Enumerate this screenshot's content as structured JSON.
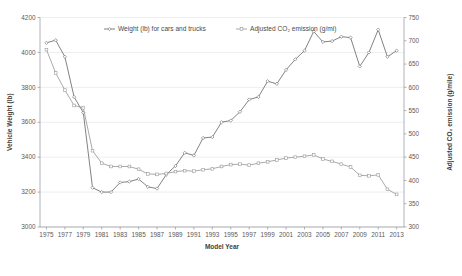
{
  "chart_data": {
    "type": "line",
    "title": "",
    "xlabel": "Model Year",
    "ylabel": "Vehicle Weight (lb)",
    "y2label": "Adjusted CO₂ emission (g/mile)",
    "x": [
      1975,
      1976,
      1977,
      1978,
      1979,
      1980,
      1981,
      1982,
      1983,
      1984,
      1985,
      1986,
      1987,
      1988,
      1989,
      1990,
      1991,
      1992,
      1993,
      1994,
      1995,
      1996,
      1997,
      1998,
      1999,
      2000,
      2001,
      2002,
      2003,
      2004,
      2005,
      2006,
      2007,
      2008,
      2009,
      2010,
      2011,
      2012,
      2013
    ],
    "xtick_labels": [
      "1975",
      "1977",
      "1979",
      "1981",
      "1983",
      "1985",
      "1987",
      "1989",
      "1991",
      "1993",
      "1995",
      "1997",
      "1999",
      "2001",
      "2003",
      "2005",
      "2007",
      "2009",
      "2011",
      "2013"
    ],
    "xtick_values": [
      1975,
      1977,
      1979,
      1981,
      1983,
      1985,
      1987,
      1989,
      1991,
      1993,
      1995,
      1997,
      1999,
      2001,
      2003,
      2005,
      2007,
      2009,
      2011,
      2013
    ],
    "xlim": [
      1974.3,
      2013.8
    ],
    "ylim": [
      3000,
      4200
    ],
    "ytick_values": [
      3000,
      3200,
      3400,
      3600,
      3800,
      4000,
      4200
    ],
    "ytick_labels": [
      "3000",
      "3200",
      "3400",
      "3600",
      "3800",
      "4000",
      "4200"
    ],
    "y2lim": [
      300,
      750
    ],
    "y2tick_values": [
      300,
      350,
      400,
      450,
      500,
      550,
      600,
      650,
      700,
      750
    ],
    "y2tick_labels": [
      "300",
      "350",
      "400",
      "450",
      "500",
      "550",
      "600",
      "650",
      "700",
      "750"
    ],
    "grid": true,
    "legend_position": "top-center",
    "series": [
      {
        "name": "Weight (lb) for cars and trucks",
        "axis": "left",
        "color": "#6b6b6b",
        "marker": "diamond",
        "values": [
          4055,
          4070,
          3975,
          3745,
          3655,
          3225,
          3200,
          3200,
          3255,
          3260,
          3275,
          3230,
          3220,
          3300,
          3350,
          3425,
          3410,
          3510,
          3515,
          3600,
          3610,
          3660,
          3730,
          3745,
          3835,
          3820,
          3900,
          3960,
          4010,
          4120,
          4060,
          4065,
          4090,
          4085,
          3920,
          4000,
          4130,
          3975,
          4010
        ]
      },
      {
        "name": "Adjusted CO₂ emission (g/mi)",
        "axis": "right",
        "color": "#9a9a9a",
        "marker": "square",
        "values": [
          681,
          631,
          594,
          561,
          556,
          464,
          437,
          430,
          430,
          430,
          424,
          414,
          413,
          415,
          419,
          421,
          420,
          423,
          425,
          430,
          434,
          435,
          433,
          437,
          440,
          444,
          448,
          450,
          452,
          455,
          446,
          441,
          435,
          429,
          411,
          410,
          412,
          381,
          370
        ]
      }
    ]
  },
  "legend": {
    "entries": [
      {
        "label": "Weight (lb) for cars and trucks",
        "marker": "diamond-marker"
      },
      {
        "label": "Adjusted CO₂ emission (g/mi)",
        "marker": "square-marker"
      }
    ]
  },
  "colors": {
    "weight_series": "#6b6b6b",
    "co2_series": "#9a9a9a",
    "grid": "#e4e7ea",
    "axis": "#9aa0a6",
    "text": "#4a4a4a"
  }
}
